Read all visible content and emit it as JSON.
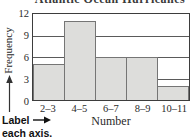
{
  "title": "Atlantic Ocean Hurricanes",
  "chart_data": {
    "type": "bar",
    "title": "Atlantic Ocean Hurricanes",
    "categories": [
      "2–3",
      "4–5",
      "6–7",
      "8–9",
      "10–11"
    ],
    "values": [
      5,
      11,
      6,
      6,
      2
    ],
    "xlabel": "Number",
    "ylabel": "Frequency",
    "ylim": [
      0,
      12
    ],
    "yticks": [
      0,
      3,
      6,
      9,
      12
    ],
    "grid": true,
    "legend": "none",
    "bar_fill": "#dddddb",
    "bar_border": "#757575",
    "frame_color": "#3d3d3d"
  },
  "annotation": {
    "line1": "Label",
    "line2": "each axis.",
    "arrow_glyph": "→"
  },
  "icons": {
    "y_axis_arrow": "up-arrow-icon",
    "label_arrow": "right-arrow-icon"
  }
}
